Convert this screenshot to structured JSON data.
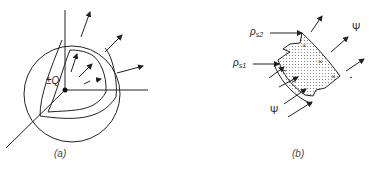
{
  "figure": {
    "panel_a": {
      "caption": "(a)",
      "charge_label": "±Q"
    },
    "panel_b": {
      "caption": "(b)",
      "rho_s2_label": "ρ",
      "rho_s2_sub": "s2",
      "rho_s1_label": "ρ",
      "rho_s1_sub": "s1",
      "psi_top_label": "Ψ",
      "psi_bottom_label": "Ψ"
    },
    "footer_caption": ""
  },
  "colors": {
    "line": "#222222",
    "background": "#ffffff",
    "dots": "#888888"
  }
}
